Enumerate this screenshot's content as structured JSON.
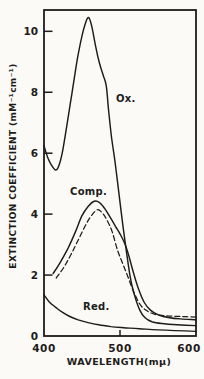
{
  "figure": {
    "kind": "spectrophotometry line chart, scanned monochrome figure"
  },
  "chart_data": {
    "type": "line",
    "title": "",
    "xlabel": "WAVELENGTH(mμ)",
    "ylabel": "EXTINCTION COEFFICIENT (mM⁻¹cm⁻¹)",
    "xlim": [
      400,
      600
    ],
    "ylim": [
      0,
      10.7
    ],
    "x_ticks": [
      400,
      500,
      600
    ],
    "y_ticks": [
      0,
      2,
      4,
      6,
      8,
      10
    ],
    "x_tick_marks": [
      500
    ],
    "y_tick_marks": [
      2,
      4,
      6,
      8,
      10
    ],
    "grid": false,
    "legend_position": "inline-annotations",
    "ink_color": "#1e1c1a",
    "series": [
      {
        "name": "Oxidized",
        "label": "Ox.",
        "line_style": "solid",
        "points": [
          [
            400,
            6.25
          ],
          [
            405,
            5.85
          ],
          [
            410,
            5.6
          ],
          [
            415,
            5.45
          ],
          [
            419,
            5.55
          ],
          [
            424,
            6.0
          ],
          [
            430,
            6.9
          ],
          [
            437,
            8.0
          ],
          [
            444,
            9.1
          ],
          [
            450,
            9.85
          ],
          [
            455,
            10.3
          ],
          [
            459,
            10.45
          ],
          [
            463,
            10.15
          ],
          [
            468,
            9.5
          ],
          [
            473,
            8.95
          ],
          [
            478,
            8.55
          ],
          [
            482,
            8.2
          ],
          [
            485,
            7.4
          ],
          [
            489,
            6.5
          ],
          [
            493,
            5.8
          ],
          [
            496,
            5.2
          ],
          [
            504,
            3.6
          ],
          [
            513,
            2.0
          ],
          [
            519,
            1.35
          ],
          [
            526,
            0.85
          ],
          [
            533,
            0.6
          ],
          [
            542,
            0.47
          ],
          [
            555,
            0.41
          ],
          [
            575,
            0.37
          ],
          [
            600,
            0.34
          ]
        ]
      },
      {
        "name": "Complex",
        "label": "Comp.",
        "line_style": "solid",
        "points": [
          [
            412,
            2.05
          ],
          [
            421,
            2.4
          ],
          [
            431,
            2.85
          ],
          [
            441,
            3.4
          ],
          [
            450,
            3.95
          ],
          [
            458,
            4.25
          ],
          [
            466,
            4.42
          ],
          [
            473,
            4.38
          ],
          [
            480,
            4.18
          ],
          [
            487,
            3.9
          ],
          [
            494,
            3.6
          ],
          [
            500,
            3.35
          ],
          [
            506,
            3.05
          ],
          [
            512,
            2.6
          ],
          [
            518,
            2.05
          ],
          [
            525,
            1.5
          ],
          [
            532,
            1.1
          ],
          [
            540,
            0.85
          ],
          [
            550,
            0.7
          ],
          [
            565,
            0.6
          ],
          [
            580,
            0.56
          ],
          [
            600,
            0.53
          ]
        ]
      },
      {
        "name": "Complex (dashed variant)",
        "label": "",
        "line_style": "dashed",
        "points": [
          [
            416,
            1.9
          ],
          [
            426,
            2.25
          ],
          [
            436,
            2.7
          ],
          [
            446,
            3.2
          ],
          [
            456,
            3.7
          ],
          [
            464,
            4.0
          ],
          [
            471,
            4.15
          ],
          [
            478,
            4.0
          ],
          [
            484,
            3.75
          ],
          [
            490,
            3.4
          ],
          [
            497,
            2.8
          ],
          [
            504,
            2.35
          ],
          [
            511,
            1.9
          ],
          [
            518,
            1.45
          ],
          [
            526,
            1.05
          ],
          [
            534,
            0.85
          ],
          [
            545,
            0.72
          ],
          [
            560,
            0.66
          ],
          [
            580,
            0.64
          ],
          [
            600,
            0.62
          ]
        ]
      },
      {
        "name": "Reduced",
        "label": "Red.",
        "line_style": "solid",
        "points": [
          [
            400,
            1.35
          ],
          [
            407,
            1.12
          ],
          [
            415,
            0.95
          ],
          [
            424,
            0.78
          ],
          [
            434,
            0.64
          ],
          [
            445,
            0.53
          ],
          [
            458,
            0.44
          ],
          [
            472,
            0.37
          ],
          [
            488,
            0.31
          ],
          [
            505,
            0.27
          ],
          [
            525,
            0.24
          ],
          [
            550,
            0.2
          ],
          [
            600,
            0.15
          ]
        ]
      }
    ]
  }
}
